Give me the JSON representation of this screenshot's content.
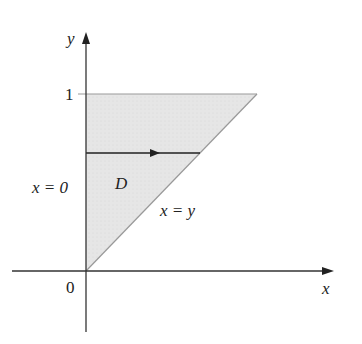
{
  "diagram": {
    "region_label": "D",
    "axis_x_label": "x",
    "axis_y_label": "y",
    "tick_y_1": "1",
    "origin_label": "0",
    "left_boundary_label": "x = 0",
    "diagonal_boundary_label": "x = y",
    "colors": {
      "region_fill": "#e4e4e4",
      "axis": "#333333",
      "boundary": "#aaaaaa"
    }
  }
}
